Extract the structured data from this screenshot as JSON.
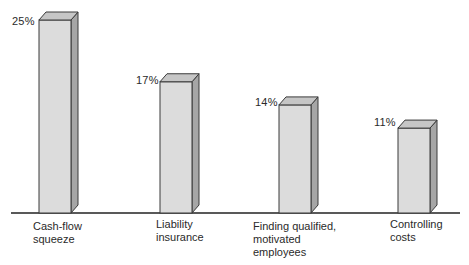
{
  "chart_data": {
    "type": "bar",
    "title": "",
    "xlabel": "",
    "ylabel": "",
    "categories": [
      "Cash-flow\nsqueeze",
      "Liability\ninsurance",
      "Finding qualified,\nmotivated\nemployees",
      "Controlling\ncosts"
    ],
    "values": [
      25,
      17,
      14,
      11
    ],
    "value_labels": [
      "25%",
      "17%",
      "14%",
      "11%"
    ],
    "unit": "%",
    "ylim": [
      0,
      25
    ],
    "grid": false,
    "legend": null,
    "style": "3d-bar",
    "colors": {
      "front": "#dcdcdc",
      "top": "#c6c6c6",
      "side": "#a6a6a6",
      "edge": "#3a3a3a",
      "baseline": "#222222"
    }
  },
  "labels": {
    "bar_1_value": "25%",
    "bar_2_value": "17%",
    "bar_3_value": "14%",
    "bar_4_value": "11%",
    "bar_1_category": "Cash-flow\nsqueeze",
    "bar_2_category": "Liability\ninsurance",
    "bar_3_category": "Finding qualified,\nmotivated\nemployees",
    "bar_4_category": "Controlling\ncosts"
  }
}
